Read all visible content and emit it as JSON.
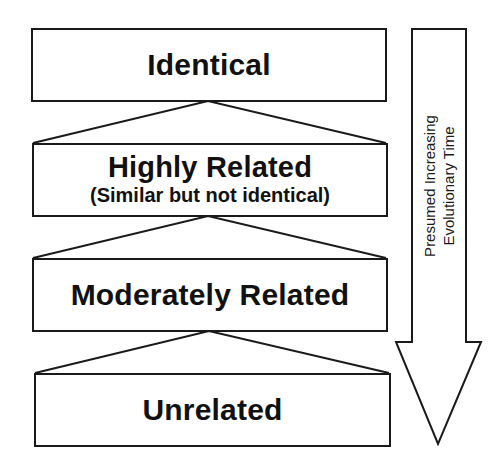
{
  "diagram": {
    "type": "hierarchy-with-time-arrow",
    "levels": [
      {
        "title": "Identical",
        "subtitle": ""
      },
      {
        "title": "Highly Related",
        "subtitle": "(Similar but not identical)"
      },
      {
        "title": "Moderately Related",
        "subtitle": ""
      },
      {
        "title": "Unrelated",
        "subtitle": ""
      }
    ],
    "connectors": [
      {
        "from": "Identical",
        "to": "Highly Related",
        "shape": "triangle"
      },
      {
        "from": "Highly Related",
        "to": "Moderately Related",
        "shape": "triangle"
      },
      {
        "from": "Moderately Related",
        "to": "Unrelated",
        "shape": "triangle"
      }
    ],
    "arrow": {
      "direction": "down",
      "label_line1": "Presumed Increasing",
      "label_line2": "Evolutionary Time"
    },
    "colors": {
      "stroke": "#1a1a1a",
      "fill": "#ffffff",
      "text": "#111111"
    }
  }
}
